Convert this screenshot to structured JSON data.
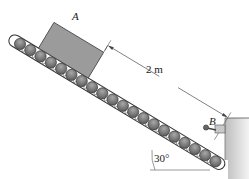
{
  "diagram": {
    "type": "inclined conveyor with block",
    "block_label": "A",
    "stop_label": "B",
    "distance_label": "2 m",
    "angle_label": "30°",
    "colors": {
      "block_fill": "#9a9a9a",
      "roller_fill": "#7d7d7d",
      "roller_dark": "#5a5a5a",
      "line": "#333333",
      "wall": "#cfcfcf"
    }
  }
}
